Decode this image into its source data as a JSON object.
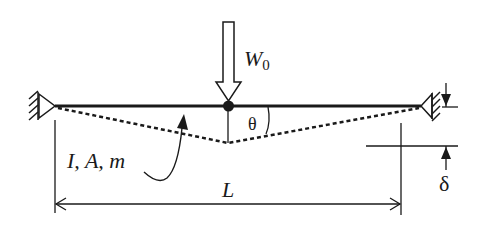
{
  "diagram": {
    "load": {
      "symbol": "W",
      "subscript": "0"
    },
    "angle_label": "θ",
    "properties_label": "I, A, m",
    "length_label": "L",
    "deflection_label": "δ",
    "colors": {
      "line": "#1a1a1a",
      "background": "#ffffff"
    }
  }
}
